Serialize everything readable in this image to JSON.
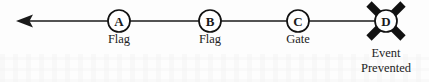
{
  "diagram": {
    "type": "timeline-sequence",
    "colors": {
      "stroke": "#111111",
      "text": "#232323",
      "node_fill": "#ffffff",
      "cross": "#111111",
      "background": "#fdfdfd"
    },
    "axis": {
      "direction": "leftward",
      "arrow_tip_x": 17,
      "line_y": 21,
      "line_start_x": 17,
      "line_end_x": 386,
      "arrowhead_name": "left-arrowhead"
    },
    "nodes": [
      {
        "id": "A",
        "letter": "A",
        "caption": "Flag",
        "cx": 119,
        "cy": 21,
        "r": 11,
        "caption_y": 43,
        "crossed_out": false
      },
      {
        "id": "B",
        "letter": "B",
        "caption": "Flag",
        "cx": 210,
        "cy": 21,
        "r": 11,
        "caption_y": 43,
        "crossed_out": false
      },
      {
        "id": "C",
        "letter": "C",
        "caption": "Gate",
        "cx": 298,
        "cy": 21,
        "r": 11,
        "caption_y": 43,
        "crossed_out": false
      },
      {
        "id": "D",
        "letter": "D",
        "caption": "Event",
        "caption_line2": "Prevented",
        "cx": 386,
        "cy": 21,
        "r": 11,
        "caption_y": 57,
        "caption2_y": 72,
        "crossed_out": true
      }
    ],
    "cross_mark": {
      "name": "x-cross-mark",
      "center_x": 386,
      "center_y": 21,
      "half_extent": 18
    }
  }
}
